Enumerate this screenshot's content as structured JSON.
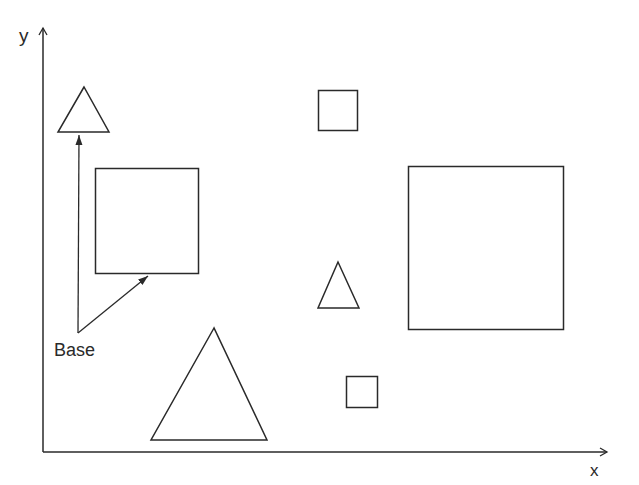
{
  "diagram": {
    "stroke_color": "#2a2a2a",
    "background": "#ffffff",
    "axes": {
      "x_label": "x",
      "y_label": "y"
    },
    "annotation": {
      "label": "Base",
      "arrows_to": [
        "triangle-top-left-base",
        "square-left-base"
      ]
    },
    "shapes": [
      {
        "id": "triangle-top-left",
        "type": "triangle",
        "size": "small"
      },
      {
        "id": "square-left",
        "type": "square",
        "size": "medium"
      },
      {
        "id": "square-top-center",
        "type": "square",
        "size": "small"
      },
      {
        "id": "triangle-center",
        "type": "triangle",
        "size": "small"
      },
      {
        "id": "square-right",
        "type": "square",
        "size": "large"
      },
      {
        "id": "triangle-bottom",
        "type": "triangle",
        "size": "large"
      },
      {
        "id": "square-bottom-center",
        "type": "square",
        "size": "small"
      }
    ]
  }
}
